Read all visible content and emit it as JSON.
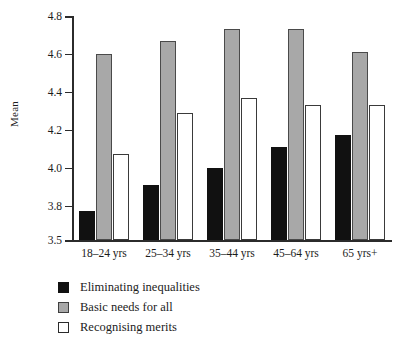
{
  "chart_data": {
    "type": "bar",
    "title": "",
    "xlabel": "",
    "ylabel": "Mean",
    "ylim": [
      3.5,
      4.8
    ],
    "yticks": [
      "3.5",
      "3.8",
      "4.0",
      "4.2",
      "4.4",
      "4.6",
      "4.8"
    ],
    "ytick_values": [
      3.5,
      3.8,
      4.0,
      4.2,
      4.4,
      4.6,
      4.8
    ],
    "grid": false,
    "legend_position": "bottom-left",
    "categories": [
      "18–24 yrs",
      "25–34 yrs",
      "35–44 yrs",
      "45–64 yrs",
      "65 yrs+"
    ],
    "series": [
      {
        "name": "Eliminating inequalities",
        "color": "#111111",
        "values": [
          3.75,
          3.91,
          4.0,
          4.11,
          4.17
        ]
      },
      {
        "name": "Basic needs for all",
        "color": "#a8a8a8",
        "values": [
          4.6,
          4.67,
          4.73,
          4.73,
          4.61
        ]
      },
      {
        "name": "Recognising merits",
        "color": "#ffffff",
        "values": [
          4.07,
          4.29,
          4.37,
          4.33,
          4.33
        ]
      }
    ]
  },
  "axis": {
    "y_title": "Mean"
  },
  "legend": {
    "items": [
      {
        "label": "Eliminating inequalities",
        "swatch": "black"
      },
      {
        "label": "Basic needs for all",
        "swatch": "gray"
      },
      {
        "label": "Recognising merits",
        "swatch": "white"
      }
    ]
  }
}
